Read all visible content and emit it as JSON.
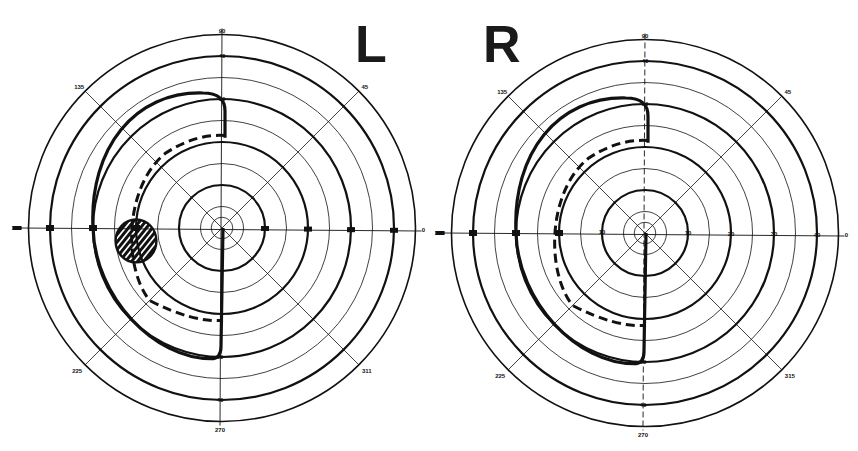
{
  "figure": {
    "type": "visual-field-perimetry-charts",
    "colors": {
      "ink": "#111111",
      "background": "#ffffff"
    }
  },
  "charts": [
    {
      "id": "left",
      "eye_label": "L",
      "center": [
        222,
        228
      ],
      "px_per_degree": 4.3,
      "rings_deg": [
        2.5,
        5,
        10,
        15,
        20,
        25,
        30,
        35,
        40,
        45
      ],
      "thick_rings_deg": [
        10,
        20,
        30,
        40
      ],
      "meridian_labels": {
        "top": "90",
        "top_45": "45",
        "top_135": "135",
        "left": "180",
        "right": "0",
        "bottom_225": "225",
        "bottom_315": "311",
        "bottom": "270"
      },
      "ring_labels_vertical": [
        "40",
        "30"
      ],
      "ring_labels_bottom": [
        "30",
        "40"
      ],
      "ring_labels_horizontal_right": [
        "10",
        "20",
        "30",
        "40"
      ],
      "isopter_solid": "hemianopic field: temporal boundary ~30deg above, ~29deg below, sharp vertical cut at midline",
      "isopter_dashed": "inner isopter ~21deg",
      "scotoma": {
        "shape": "hatched circle",
        "center_deg": [
          -20,
          3
        ],
        "radius_deg": 5
      }
    },
    {
      "id": "right",
      "eye_label": "R",
      "center": [
        645,
        233
      ],
      "px_per_degree": 4.3,
      "rings_deg": [
        2.5,
        5,
        10,
        15,
        20,
        25,
        30,
        35,
        40,
        45
      ],
      "thick_rings_deg": [
        10,
        20,
        30,
        40
      ],
      "meridian_labels": {
        "top": "90",
        "top_45": "45",
        "top_135": "135",
        "left": "180",
        "right": "0",
        "bottom_225": "225",
        "bottom_315": "315",
        "bottom": "270"
      },
      "ring_labels_vertical": [
        "40",
        "30"
      ],
      "ring_labels_bottom": [
        "30",
        "40"
      ],
      "ring_labels_horizontal_right": [
        "10",
        "20",
        "30",
        "40"
      ],
      "ring_labels_horizontal_left": [
        "10",
        "20"
      ],
      "isopter_solid": "hemianopic field: boundary ~30deg, vertical cut at midline",
      "isopter_dashed": "inner isopter ~21deg"
    }
  ]
}
